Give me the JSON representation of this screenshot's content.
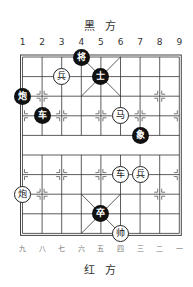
{
  "board": {
    "top_side_label": "黑 方",
    "bottom_side_label": "红 方",
    "top_files": [
      "1",
      "2",
      "3",
      "4",
      "5",
      "6",
      "7",
      "8",
      "9"
    ],
    "bottom_files": [
      "九",
      "八",
      "七",
      "六",
      "五",
      "四",
      "三",
      "二",
      "一"
    ],
    "pieces": [
      {
        "label": "将",
        "side": "black",
        "col": 4,
        "row": 0
      },
      {
        "label": "士",
        "side": "black",
        "col": 5,
        "row": 1
      },
      {
        "label": "兵",
        "side": "red",
        "col": 3,
        "row": 1
      },
      {
        "label": "炮",
        "side": "black",
        "col": 1,
        "row": 2
      },
      {
        "label": "车",
        "side": "black",
        "col": 2,
        "row": 3
      },
      {
        "label": "马",
        "side": "red",
        "col": 6,
        "row": 3
      },
      {
        "label": "象",
        "side": "black",
        "col": 7,
        "row": 4
      },
      {
        "label": "车",
        "side": "red",
        "col": 6,
        "row": 6
      },
      {
        "label": "兵",
        "side": "red",
        "col": 7,
        "row": 6
      },
      {
        "label": "炮",
        "side": "red",
        "col": 1,
        "row": 7
      },
      {
        "label": "卒",
        "side": "black",
        "col": 5,
        "row": 8
      },
      {
        "label": "帅",
        "side": "red",
        "col": 6,
        "row": 9
      }
    ]
  },
  "colors": {
    "black_piece": "#111111",
    "red_piece_fill": "#ffffff",
    "grid_line": "#333333"
  }
}
